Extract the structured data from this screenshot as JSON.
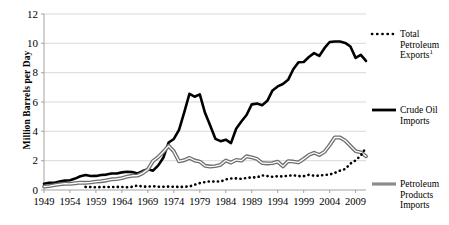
{
  "chart_data": {
    "type": "line",
    "title": "",
    "xlabel": "",
    "ylabel": "Million Barrels per Day",
    "xlim": [
      1949,
      2011
    ],
    "ylim": [
      0,
      12
    ],
    "yticks": [
      0,
      2,
      4,
      6,
      8,
      10,
      12
    ],
    "xticks": [
      1949,
      1954,
      1959,
      1964,
      1969,
      1974,
      1979,
      1984,
      1989,
      1994,
      1999,
      2004,
      2009
    ],
    "grid": "horizontal",
    "legend_position": "right",
    "x": [
      1949,
      1950,
      1951,
      1952,
      1953,
      1954,
      1955,
      1956,
      1957,
      1958,
      1959,
      1960,
      1961,
      1962,
      1963,
      1964,
      1965,
      1966,
      1967,
      1968,
      1969,
      1970,
      1971,
      1972,
      1973,
      1974,
      1975,
      1976,
      1977,
      1978,
      1979,
      1980,
      1981,
      1982,
      1983,
      1984,
      1985,
      1986,
      1987,
      1988,
      1989,
      1990,
      1991,
      1992,
      1993,
      1994,
      1995,
      1996,
      1997,
      1998,
      1999,
      2000,
      2001,
      2002,
      2003,
      2004,
      2005,
      2006,
      2007,
      2008,
      2009,
      2010,
      2011
    ],
    "series": [
      {
        "name": "Crude Oil Imports",
        "style": "solid",
        "color": "#000000",
        "width": 2.6,
        "values": [
          0.42,
          0.49,
          0.49,
          0.57,
          0.64,
          0.66,
          0.78,
          0.94,
          1.02,
          0.95,
          0.96,
          1.02,
          1.05,
          1.13,
          1.13,
          1.2,
          1.24,
          1.22,
          1.13,
          1.29,
          1.41,
          1.32,
          1.68,
          2.22,
          3.24,
          3.48,
          4.1,
          5.29,
          6.56,
          6.36,
          6.52,
          5.26,
          4.4,
          3.49,
          3.33,
          3.43,
          3.2,
          4.18,
          4.67,
          5.11,
          5.84,
          5.89,
          5.78,
          6.08,
          6.79,
          7.06,
          7.23,
          7.51,
          8.23,
          8.71,
          8.73,
          9.07,
          9.33,
          9.14,
          9.67,
          10.09,
          10.13,
          10.12,
          10.03,
          9.78,
          9.01,
          9.21,
          8.8
        ]
      },
      {
        "name": "Petroleum Products Imports",
        "style": "solid",
        "color": "#8c8c8c",
        "width": 2.4,
        "values": [
          0.23,
          0.27,
          0.33,
          0.39,
          0.43,
          0.42,
          0.46,
          0.5,
          0.49,
          0.52,
          0.57,
          0.6,
          0.65,
          0.73,
          0.75,
          0.81,
          0.91,
          0.97,
          0.98,
          1.15,
          1.4,
          1.98,
          2.25,
          2.61,
          3.01,
          2.63,
          1.95,
          2.03,
          2.19,
          2.01,
          1.94,
          1.65,
          1.6,
          1.63,
          1.72,
          2.01,
          1.87,
          2.05,
          2.0,
          2.3,
          2.22,
          2.12,
          1.84,
          1.81,
          1.83,
          1.93,
          1.61,
          1.97,
          1.94,
          1.88,
          2.12,
          2.39,
          2.54,
          2.39,
          2.6,
          3.06,
          3.59,
          3.58,
          3.37,
          3.01,
          2.65,
          2.57,
          2.3
        ]
      },
      {
        "name": "Total Petroleum Exports",
        "label_superscript": "1",
        "style": "dotted",
        "color": "#000000",
        "width": 2.6,
        "values": [
          null,
          null,
          null,
          null,
          null,
          null,
          null,
          null,
          0.21,
          0.2,
          0.19,
          0.2,
          0.2,
          0.2,
          0.21,
          0.21,
          0.19,
          0.22,
          0.31,
          0.23,
          0.23,
          0.26,
          0.22,
          0.22,
          0.23,
          0.22,
          0.21,
          0.22,
          0.24,
          0.36,
          0.47,
          0.54,
          0.59,
          0.58,
          0.58,
          0.72,
          0.78,
          0.79,
          0.76,
          0.82,
          0.86,
          0.86,
          1.0,
          0.95,
          0.9,
          0.94,
          0.92,
          0.98,
          1.0,
          0.95,
          0.94,
          1.04,
          0.97,
          0.98,
          1.03,
          1.05,
          1.17,
          1.32,
          1.43,
          1.8,
          2.02,
          2.35,
          2.89
        ]
      }
    ]
  },
  "axis": {
    "ylabel": "Million Barrels per Day",
    "ytick_labels": [
      "12",
      "10",
      "8",
      "6",
      "4",
      "2",
      "0"
    ],
    "xtick_labels": [
      "1949",
      "1954",
      "1959",
      "1964",
      "1969",
      "1974",
      "1979",
      "1984",
      "1989",
      "1994",
      "1999",
      "2004",
      "2009"
    ]
  },
  "legend": {
    "entries": [
      {
        "key": "total-petroleum-exports",
        "lines": [
          "Total",
          "Petroleum",
          "Exports"
        ],
        "superscript": "1",
        "marker": "dotted-black"
      },
      {
        "key": "crude-oil-imports",
        "lines": [
          "Crude Oil",
          "Imports"
        ],
        "superscript": "",
        "marker": "solid-black"
      },
      {
        "key": "petroleum-products-imports",
        "lines": [
          "Petroleum",
          "Products",
          "Imports"
        ],
        "superscript": "",
        "marker": "solid-gray"
      }
    ]
  },
  "colors": {
    "crude": "#000000",
    "products": "#8c8c8c",
    "exports": "#000000",
    "grid": "#c8c8c8",
    "axis": "#9a9a9a"
  }
}
